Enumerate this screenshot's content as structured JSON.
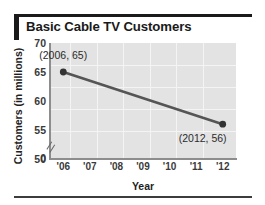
{
  "title": "Basic Cable TV Customers",
  "colors": {
    "title": "#1a1a1a",
    "plot_background": "#e3e3e3",
    "gridline": "#f4f4f4",
    "axis": "#8d8d8d",
    "series_line": "#555555",
    "marker": "#333333"
  },
  "chart_data": {
    "type": "line",
    "title": "Basic Cable TV Customers",
    "xlabel": "Year",
    "ylabel": "Customers (in millions)",
    "x": [
      2006,
      2012
    ],
    "values": [
      65,
      56
    ],
    "series": [
      {
        "name": "Basic Cable TV Customers",
        "x": [
          2006,
          2012
        ],
        "values": [
          65,
          56
        ]
      }
    ],
    "point_labels": [
      "(2006, 65)",
      "(2012, 56)"
    ],
    "x_tick_labels": [
      "'06",
      "'07",
      "'08",
      "'09",
      "'10",
      "'11",
      "'12"
    ],
    "x_tick_values": [
      2006,
      2007,
      2008,
      2009,
      2010,
      2011,
      2012
    ],
    "y_tick_labels": [
      "70",
      "65",
      "60",
      "55",
      "50",
      "0"
    ],
    "y_tick_values": [
      70,
      65,
      60,
      55,
      50,
      0
    ],
    "ylim": [
      50,
      70
    ],
    "xlim": [
      2005.5,
      2012.5
    ],
    "y_axis_break": true,
    "y_axis_break_symbol": "//",
    "grid": true,
    "legend": false
  }
}
